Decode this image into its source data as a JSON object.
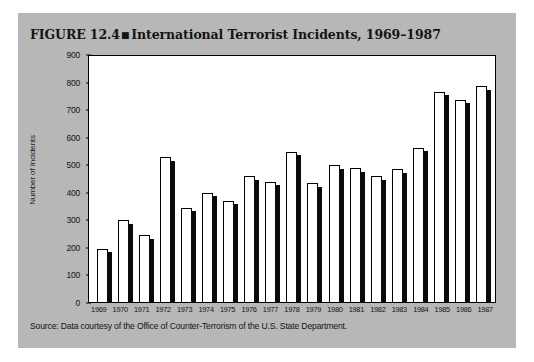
{
  "figure": {
    "label": "FIGURE 12.4",
    "bullet": "■",
    "title": "International Terrorist Incidents, 1969–1987",
    "source": "Source: Data courtesy of the Office of Counter-Terrorism of the U.S. State Department."
  },
  "chart_data": {
    "type": "bar",
    "title": "International Terrorist Incidents, 1969–1987",
    "xlabel": "",
    "ylabel": "Number of Incidents",
    "ylim": [
      0,
      900
    ],
    "ytick_step": 100,
    "yticks": [
      0,
      100,
      200,
      300,
      400,
      500,
      600,
      700,
      800,
      900
    ],
    "grid": false,
    "legend": false,
    "categories": [
      "1969",
      "1970",
      "1971",
      "1972",
      "1973",
      "1974",
      "1975",
      "1976",
      "1977",
      "1978",
      "1979",
      "1980",
      "1981",
      "1982",
      "1983",
      "1984",
      "1985",
      "1986",
      "1987"
    ],
    "values": [
      195,
      300,
      245,
      530,
      345,
      400,
      370,
      460,
      440,
      550,
      435,
      500,
      490,
      460,
      485,
      565,
      770,
      740,
      790
    ]
  },
  "colors": {
    "panel_background": "#b7b7b7",
    "plot_background": "#ffffff",
    "bar_face": "#ffffff",
    "bar_outline": "#000000",
    "bar_shadow": "#0a0a0a",
    "text": "#141414"
  }
}
